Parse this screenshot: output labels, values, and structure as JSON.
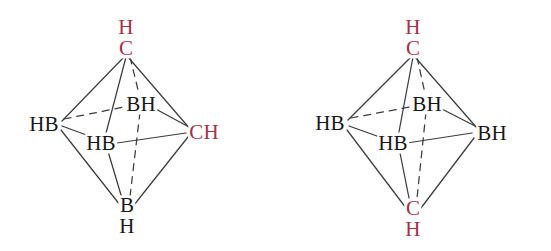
{
  "figure": {
    "background_color": "#ffffff",
    "carbon_color": "#a8304a",
    "boron_color": "#17171a",
    "edge_color": "#3c3c3c"
  },
  "structures": [
    {
      "id": "left-octahedron",
      "name": "1,2-dicarba-closo-hexaborane",
      "vertices": {
        "top": {
          "name": "top-vertex",
          "lines": [
            "H",
            "C"
          ],
          "element": "carbon",
          "layout": "stacked"
        },
        "left": {
          "name": "left-vertex",
          "lines": [
            "HB"
          ],
          "element": "boron",
          "layout": "inline"
        },
        "right": {
          "name": "right-vertex",
          "lines": [
            "CH"
          ],
          "element": "carbon",
          "layout": "inline"
        },
        "back": {
          "name": "back-vertex",
          "lines": [
            "BH"
          ],
          "element": "boron",
          "layout": "inline"
        },
        "front": {
          "name": "front-vertex",
          "lines": [
            "HB"
          ],
          "element": "boron",
          "layout": "inline"
        },
        "bottom": {
          "name": "bottom-vertex",
          "lines": [
            "B",
            "H"
          ],
          "element": "boron",
          "layout": "stacked"
        }
      }
    },
    {
      "id": "right-octahedron",
      "name": "1,6-dicarba-closo-hexaborane",
      "vertices": {
        "top": {
          "name": "top-vertex",
          "lines": [
            "H",
            "C"
          ],
          "element": "carbon",
          "layout": "stacked"
        },
        "left": {
          "name": "left-vertex",
          "lines": [
            "HB"
          ],
          "element": "boron",
          "layout": "inline"
        },
        "right": {
          "name": "right-vertex",
          "lines": [
            "BH"
          ],
          "element": "boron",
          "layout": "inline"
        },
        "back": {
          "name": "back-vertex",
          "lines": [
            "BH"
          ],
          "element": "boron",
          "layout": "inline"
        },
        "front": {
          "name": "front-vertex",
          "lines": [
            "HB"
          ],
          "element": "boron",
          "layout": "inline"
        },
        "bottom": {
          "name": "bottom-vertex",
          "lines": [
            "C",
            "H"
          ],
          "element": "carbon",
          "layout": "stacked"
        }
      }
    }
  ]
}
